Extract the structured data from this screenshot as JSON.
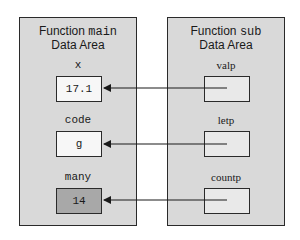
{
  "main_area": {
    "title_prefix": "Function ",
    "function_name": "main",
    "title_suffix": "Data Area",
    "variables": [
      {
        "name": "x",
        "value": "17.1",
        "shaded": false
      },
      {
        "name": "code",
        "value": "g",
        "shaded": false
      },
      {
        "name": "many",
        "value": "14",
        "shaded": true
      }
    ]
  },
  "sub_area": {
    "title_prefix": "Function ",
    "function_name": "sub",
    "title_suffix": "Data Area",
    "pointers": [
      {
        "name": "valp",
        "points_to": "x"
      },
      {
        "name": "letp",
        "points_to": "code"
      },
      {
        "name": "countp",
        "points_to": "many"
      }
    ]
  },
  "colors": {
    "panel_fill": "#d9d9d9",
    "box_fill": "#f7f7f7",
    "shaded_box_fill": "#a8a8a8",
    "pointer_box_fill": "#e9e9e9",
    "line": "#1a1a1a"
  }
}
